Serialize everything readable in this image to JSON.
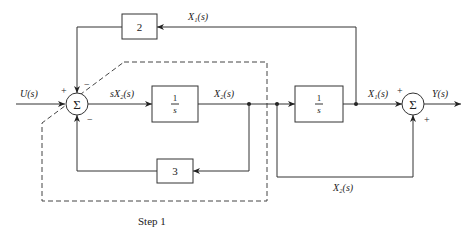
{
  "diagram": {
    "type": "block-diagram",
    "signals": {
      "input": "U(s)",
      "sx2": "sX₂(s)",
      "x2_top": "X₂(s)",
      "x1_top": "X₁(s)",
      "x1_right": "X₁(s)",
      "output": "Y(s)",
      "x2_bottom": "X₂(s)"
    },
    "blocks": {
      "gain_top": "2",
      "integrator1_num": "1",
      "integrator1_den": "s",
      "gain_bottom": "3",
      "integrator2_num": "1",
      "integrator2_den": "s"
    },
    "summers": {
      "left_symbol": "Σ",
      "left_signs": {
        "input": "+",
        "top": "−",
        "bottom": "−"
      },
      "right_symbol": "Σ",
      "right_signs": {
        "left": "+",
        "bottom": "+"
      }
    },
    "caption": "Step 1"
  }
}
